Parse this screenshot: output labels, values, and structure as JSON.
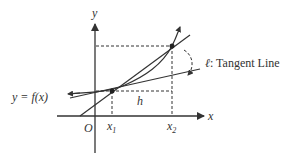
{
  "diagram": {
    "labels": {
      "y_axis": "y",
      "x_axis": "x",
      "origin": "O",
      "x1": "x",
      "x1_sub": "1",
      "x2": "x",
      "x2_sub": "2",
      "h": "h",
      "function": "y = f(x)",
      "tangent_symbol": "ℓ",
      "tangent_text": ": Tangent Line"
    },
    "colors": {
      "stroke": "#333333",
      "background": "#ffffff"
    }
  }
}
